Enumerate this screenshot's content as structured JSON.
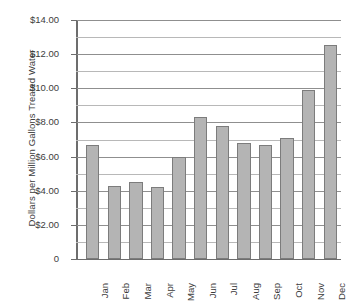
{
  "chart_data": {
    "type": "bar",
    "title": "",
    "xlabel": "",
    "ylabel": "Dollars per Million Gallons Treated Water",
    "categories": [
      "Jan",
      "Feb",
      "Mar",
      "Apr",
      "May",
      "Jun",
      "Jul",
      "Aug",
      "Sep",
      "Oct",
      "Nov",
      "Dec"
    ],
    "values": [
      6.65,
      4.25,
      4.5,
      4.2,
      5.95,
      8.3,
      7.8,
      6.8,
      6.65,
      7.1,
      9.9,
      12.55
    ],
    "ylim": [
      0,
      14
    ],
    "ytick_values": [
      0,
      2,
      4,
      6,
      8,
      10,
      12,
      14
    ],
    "ytick_labels": [
      "0",
      "$2.00",
      "$4.00",
      "$6.00",
      "$8.00",
      "$10.00",
      "$12.00",
      "$14.00"
    ],
    "minor_gridline_values": [
      1,
      3,
      5,
      7,
      9,
      11,
      13
    ],
    "grid": true,
    "legend": false,
    "bar_color": "#b4b4b4",
    "bar_border_color": "#7c7c7c",
    "axis_color": "#6d6d6d",
    "gridline_color": "#8f8f8f",
    "minor_gridline_color": "#b8b8b8",
    "background_color": "#ffffff"
  }
}
